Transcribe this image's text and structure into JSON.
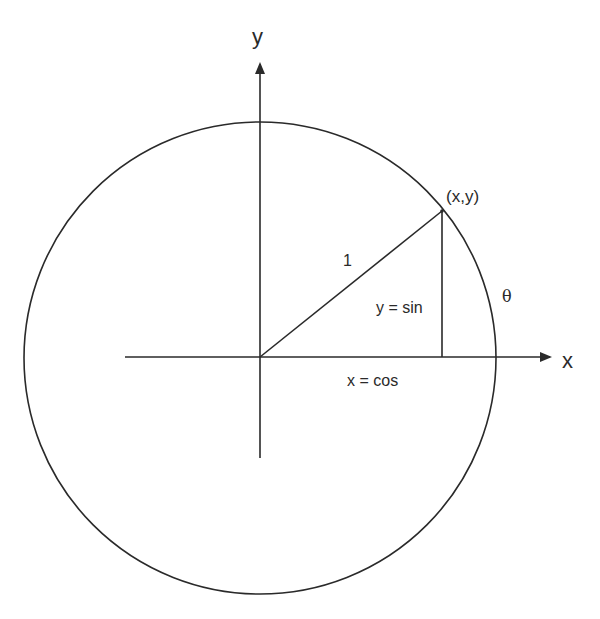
{
  "diagram": {
    "type": "unit-circle",
    "labels": {
      "y_axis": "y",
      "x_axis": "x",
      "point": "(x,y)",
      "hypotenuse": "1",
      "opposite": "y = sin",
      "adjacent": "x = cos",
      "angle": "θ"
    },
    "geometry": {
      "origin": [
        260,
        357
      ],
      "radius": 236,
      "point_on_circle": [
        442,
        211
      ],
      "x_axis_range": [
        125,
        552
      ],
      "y_axis_range": [
        62,
        458
      ]
    },
    "colors": {
      "stroke": "#2a2a2a",
      "background": "#ffffff"
    }
  }
}
